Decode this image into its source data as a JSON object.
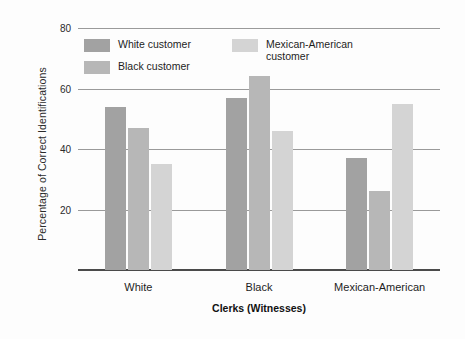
{
  "chart_data": {
    "type": "bar",
    "title": "",
    "xlabel": "Clerks (Witnesses)",
    "ylabel": "Percentage of Correct Identifications",
    "categories": [
      "White",
      "Black",
      "Mexican-American"
    ],
    "series": [
      {
        "name": "White customer",
        "color": "#a2a2a2",
        "values": [
          54,
          57,
          37
        ]
      },
      {
        "name": "Black customer",
        "color": "#b7b7b7",
        "values": [
          47,
          64,
          26
        ]
      },
      {
        "name": "Mexican-American\ncustomer",
        "color": "#d4d4d4",
        "values": [
          35,
          46,
          55
        ]
      }
    ],
    "ylim": [
      0,
      80
    ],
    "yticks": [
      20,
      40,
      60,
      80
    ],
    "ytick_labels": [
      "20",
      "40",
      "60",
      "80"
    ],
    "grid": true,
    "legend_position": "inside-top-left",
    "background_color": "#fdfdfd",
    "axis_color": "#4a4a4a",
    "gridline_color": "#9a9a9a"
  }
}
